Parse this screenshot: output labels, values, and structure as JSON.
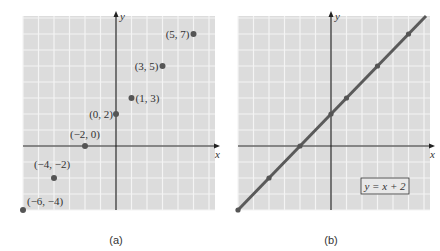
{
  "chart_data": [
    {
      "type": "scatter",
      "panel_label": "(a)",
      "xlabel": "x",
      "ylabel": "y",
      "grid": true,
      "xlim": [
        -6,
        6
      ],
      "ylim": [
        -4,
        8
      ],
      "points": [
        {
          "x": -6,
          "y": -4,
          "label": "(−6, −4)"
        },
        {
          "x": -4,
          "y": -2,
          "label": "(−4, −2)"
        },
        {
          "x": -2,
          "y": 0,
          "label": "(−2, 0)"
        },
        {
          "x": 0,
          "y": 2,
          "label": "(0, 2)"
        },
        {
          "x": 1,
          "y": 3,
          "label": "(1, 3)"
        },
        {
          "x": 3,
          "y": 5,
          "label": "(3, 5)"
        },
        {
          "x": 5,
          "y": 7,
          "label": "(5, 7)"
        }
      ]
    },
    {
      "type": "line",
      "panel_label": "(b)",
      "xlabel": "x",
      "ylabel": "y",
      "grid": true,
      "xlim": [
        -6,
        6
      ],
      "ylim": [
        -4,
        8
      ],
      "equation_label": "y = x + 2",
      "series": [
        {
          "name": "y = x + 2",
          "x": [
            -6,
            -4,
            -2,
            0,
            1,
            3,
            5
          ],
          "y": [
            -4,
            -2,
            0,
            2,
            3,
            5,
            7
          ]
        }
      ]
    }
  ],
  "colors": {
    "grid_bg": "#dcdcdc",
    "grid_line": "#f4f4f4",
    "axis": "#222222",
    "point": "#555555",
    "line": "#5a5a5a"
  }
}
